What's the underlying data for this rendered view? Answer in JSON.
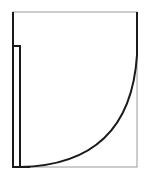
{
  "diagram": {
    "type": "floor-plan-door-swing-symbol",
    "colors": {
      "background": "#ffffff",
      "frame": "#999999",
      "stroke": "#1a1a1a"
    },
    "frame": {
      "x": 13,
      "y": 12,
      "width": 124,
      "height": 155
    },
    "door_leaf": {
      "x": 13,
      "y": 46,
      "width": 7,
      "height": 121
    },
    "swing_arc": {
      "start": [
        20,
        167
      ],
      "end": [
        137,
        55
      ]
    },
    "left_jamb": {
      "x": 13,
      "y1": 12,
      "y2": 167
    },
    "right_jamb": {
      "x": 137,
      "y1": 12,
      "y2": 55
    }
  }
}
